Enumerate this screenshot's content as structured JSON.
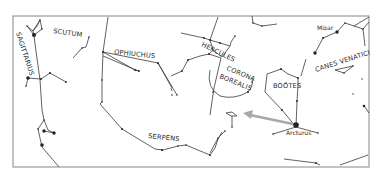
{
  "map": {
    "title": "Star chart around Boötes and Arcturus",
    "constellations": [
      {
        "id": "sagittarius",
        "label": "SAGITTARIUS"
      },
      {
        "id": "scutum",
        "label": "SCUTUM"
      },
      {
        "id": "ophiuchus",
        "label": "OPHIUCHUS"
      },
      {
        "id": "hercules",
        "label": "HERCULES"
      },
      {
        "id": "corona-borealis",
        "label_line1": "CORONA",
        "label_line2": "BOREALIS"
      },
      {
        "id": "bootes",
        "label": "BOÖTES"
      },
      {
        "id": "canes-venatici",
        "label": "CANES VENATICI"
      },
      {
        "id": "serpens",
        "label": "SERPENS"
      }
    ],
    "stars": [
      {
        "id": "arcturus",
        "label": "Arcturus"
      },
      {
        "id": "mizar",
        "label": "Mizar"
      }
    ],
    "pointer": {
      "from": "Arcturus",
      "direction": "west",
      "color": "#a8a8a8"
    },
    "colors": {
      "frame": "#9a9a9a",
      "lines": "#3a3a3a",
      "stars": "#222222",
      "background": "#ffffff"
    }
  }
}
